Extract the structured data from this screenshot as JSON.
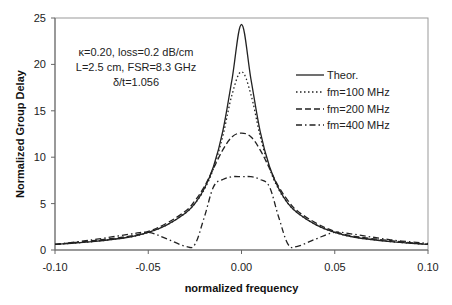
{
  "chart_data": {
    "type": "line",
    "title": "",
    "xlabel": "normalized frequency",
    "ylabel": "Normalized Group Delay",
    "xlim": [
      -0.1,
      0.1
    ],
    "ylim": [
      0,
      25
    ],
    "x_ticks": [
      "-0.10",
      "-0.05",
      "0.00",
      "0.05",
      "0.10"
    ],
    "y_ticks": [
      "0",
      "5",
      "10",
      "15",
      "20",
      "25"
    ],
    "grid": false,
    "legend_position": "right, upper-middle",
    "annotations": [
      "κ=0.20, loss=0.2 dB/cm",
      "L=2.5 cm, FSR=8.3 GHz",
      "δ/t=1.056"
    ],
    "x": [
      -0.1,
      -0.08,
      -0.06,
      -0.05,
      -0.04,
      -0.03,
      -0.025,
      -0.02,
      -0.015,
      -0.01,
      -0.005,
      0.0,
      0.005,
      0.01,
      0.015,
      0.02,
      0.025,
      0.03,
      0.04,
      0.05,
      0.06,
      0.08,
      0.1
    ],
    "series": [
      {
        "name": "Theor.",
        "style": "solid",
        "values": [
          0.6,
          0.9,
          1.4,
          1.9,
          2.7,
          4.0,
          5.0,
          6.6,
          9.0,
          12.8,
          18.5,
          24.3,
          18.5,
          12.8,
          9.0,
          6.6,
          5.0,
          4.0,
          2.7,
          1.9,
          1.4,
          0.9,
          0.6
        ]
      },
      {
        "name": "fm=100 MHz",
        "style": "dotted",
        "values": [
          0.6,
          0.9,
          1.4,
          1.9,
          2.7,
          4.0,
          5.0,
          6.5,
          8.8,
          12.3,
          16.8,
          19.2,
          16.8,
          12.3,
          8.8,
          6.5,
          5.0,
          4.0,
          2.7,
          1.9,
          1.4,
          0.9,
          0.6
        ]
      },
      {
        "name": "fm=200 MHz",
        "style": "dashed",
        "values": [
          0.6,
          1.0,
          1.5,
          2.0,
          2.9,
          4.2,
          5.3,
          6.8,
          8.8,
          10.8,
          12.2,
          12.6,
          12.2,
          10.8,
          8.8,
          6.8,
          5.3,
          4.2,
          2.9,
          2.0,
          1.5,
          1.0,
          0.6
        ]
      },
      {
        "name": "fm=400 MHz",
        "style": "dash-dot",
        "values": [
          0.6,
          1.1,
          1.7,
          1.9,
          1.2,
          0.4,
          0.6,
          3.5,
          6.8,
          7.6,
          7.9,
          7.9,
          7.9,
          7.6,
          6.8,
          3.5,
          0.6,
          0.4,
          1.2,
          1.9,
          1.7,
          1.1,
          0.7
        ]
      }
    ]
  },
  "legend": {
    "items": [
      {
        "label": "Theor.",
        "dash": ""
      },
      {
        "label": "fm=100 MHz",
        "dash": "1.5,2.5"
      },
      {
        "label": "fm=200 MHz",
        "dash": "6,3"
      },
      {
        "label": "fm=400 MHz",
        "dash": "6,3,1.5,3"
      }
    ]
  },
  "colors": {
    "line": "#222222",
    "axis": "#666666"
  }
}
